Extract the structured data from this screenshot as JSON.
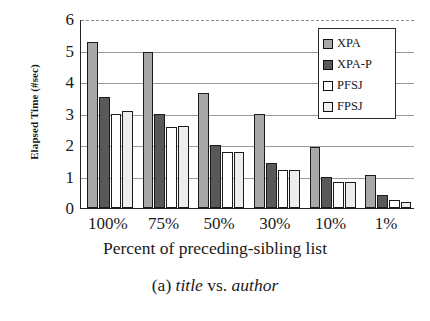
{
  "figure": {
    "caption_prefix": "(a) ",
    "caption_italic_1": "title",
    "caption_middle": " vs. ",
    "caption_italic_2": "author"
  },
  "chart_data": {
    "type": "bar",
    "title": "",
    "subtitle": "",
    "xlabel": "Percent of preceding-sibling list",
    "ylabel": "Elapsed Time (#sec)",
    "categories": [
      "100%",
      "75%",
      "50%",
      "30%",
      "10%",
      "1%"
    ],
    "yticks": [
      6,
      5,
      4,
      3,
      2,
      1,
      0
    ],
    "ylim": [
      0,
      6
    ],
    "grid": "horizontal",
    "legend_position": "top-right-inside",
    "series": [
      {
        "name": "XPA",
        "color": "#a8a8a8",
        "values": [
          5.27,
          4.95,
          3.65,
          3.0,
          1.93,
          1.05
        ]
      },
      {
        "name": "XPA-P",
        "color": "#595959",
        "values": [
          3.52,
          3.0,
          2.0,
          1.43,
          1.0,
          0.42
        ]
      },
      {
        "name": "PFSJ",
        "color": "#ffffff",
        "values": [
          3.0,
          2.58,
          1.78,
          1.2,
          0.82,
          0.25
        ]
      },
      {
        "name": "FPSJ",
        "color": "#ededed",
        "values": [
          3.08,
          2.6,
          1.78,
          1.2,
          0.82,
          0.2
        ]
      }
    ]
  }
}
